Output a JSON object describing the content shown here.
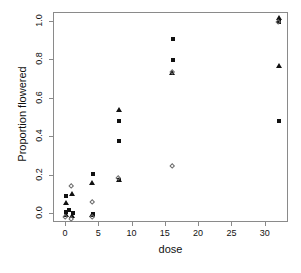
{
  "chart_data": {
    "type": "scatter",
    "title": "",
    "xlabel": "dose",
    "ylabel": "Proportion flowered",
    "xlim": [
      -1.8,
      33.5
    ],
    "ylim": [
      -0.045,
      1.045
    ],
    "xticks": [
      0,
      5,
      10,
      15,
      20,
      25,
      30
    ],
    "xticklabels": [
      "0",
      "5",
      "10",
      "15",
      "20",
      "25",
      "30"
    ],
    "yticks": [
      0.0,
      0.2,
      0.4,
      0.6,
      0.8,
      1.0
    ],
    "yticklabels": [
      "0.0",
      "0.2",
      "0.4",
      "0.6",
      "0.8",
      "1.0"
    ],
    "grid": false,
    "legend": "none",
    "series": [
      {
        "name": "filled-square",
        "marker": "square",
        "color": "#111111",
        "points": [
          {
            "x": 0.0,
            "y": 0.095
          },
          {
            "x": 0.0,
            "y": 0.01
          },
          {
            "x": 0.5,
            "y": 0.022
          },
          {
            "x": 1.0,
            "y": 0.008
          },
          {
            "x": 4.0,
            "y": 0.21
          },
          {
            "x": 4.0,
            "y": 0.0
          },
          {
            "x": 8.0,
            "y": 0.485
          },
          {
            "x": 8.0,
            "y": 0.38
          },
          {
            "x": 8.0,
            "y": 0.178
          },
          {
            "x": 16.0,
            "y": 0.91
          },
          {
            "x": 16.0,
            "y": 0.8
          },
          {
            "x": 32.0,
            "y": 1.0
          },
          {
            "x": 32.0,
            "y": 0.485
          }
        ]
      },
      {
        "name": "filled-triangle",
        "marker": "triangle",
        "color": "#111111",
        "points": [
          {
            "x": 0.0,
            "y": 0.055
          },
          {
            "x": 0.0,
            "y": -0.005
          },
          {
            "x": 1.0,
            "y": 0.105
          },
          {
            "x": 1.0,
            "y": -0.01
          },
          {
            "x": 4.0,
            "y": 0.16
          },
          {
            "x": 4.0,
            "y": -0.008
          },
          {
            "x": 8.0,
            "y": 0.54
          },
          {
            "x": 8.0,
            "y": 0.175
          },
          {
            "x": 16.0,
            "y": 0.73
          },
          {
            "x": 32.0,
            "y": 1.015
          },
          {
            "x": 32.0,
            "y": 0.77
          }
        ]
      },
      {
        "name": "open-diamond",
        "marker": "diamond",
        "color": "#6b6b6b",
        "points": [
          {
            "x": 0.0,
            "y": -0.02
          },
          {
            "x": 0.8,
            "y": 0.145
          },
          {
            "x": 0.8,
            "y": -0.028
          },
          {
            "x": 4.0,
            "y": 0.06
          },
          {
            "x": 4.0,
            "y": -0.02
          },
          {
            "x": 8.0,
            "y": 0.182
          },
          {
            "x": 16.0,
            "y": 0.735
          },
          {
            "x": 16.0,
            "y": 0.245
          },
          {
            "x": 32.0,
            "y": 0.995
          }
        ]
      }
    ]
  }
}
